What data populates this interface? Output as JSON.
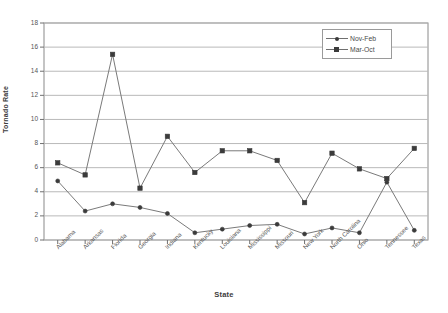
{
  "chart_data": {
    "type": "line",
    "title": "",
    "xlabel": "State",
    "ylabel": "Tornado Rate",
    "ylim": [
      0,
      18
    ],
    "ytick_step": 2,
    "yticks": [
      "0",
      "2",
      "4",
      "6",
      "8",
      "10",
      "12",
      "14",
      "16",
      "18"
    ],
    "grid": true,
    "legend_position": "top-right",
    "categories": [
      "Alabama",
      "Arkansas",
      "Florida",
      "Georgia",
      "Indiana",
      "Kentucky",
      "Louisiana",
      "Mississippi",
      "Missouri",
      "New York",
      "North Carolina",
      "Ohio",
      "Tennessee",
      "Texas"
    ],
    "series": [
      {
        "name": "Nov-Feb",
        "marker": "diamond",
        "color": "#3b3b3b",
        "values": [
          4.9,
          2.4,
          3.0,
          2.7,
          2.2,
          0.6,
          0.9,
          1.2,
          1.3,
          0.5,
          1.0,
          0.6,
          4.8,
          0.8
        ]
      },
      {
        "name": "Mar-Oct",
        "marker": "square",
        "color": "#3b3b3b",
        "values": [
          6.4,
          5.4,
          15.4,
          4.3,
          8.6,
          5.6,
          7.4,
          7.4,
          6.6,
          3.1,
          7.2,
          5.9,
          5.1,
          7.6
        ]
      }
    ]
  },
  "legend": {
    "items": [
      {
        "label": "Nov-Feb",
        "marker": "diamond"
      },
      {
        "label": "Mar-Oct",
        "marker": "square"
      }
    ]
  },
  "axes": {
    "y_title": "Tornado Rate",
    "x_title": "State"
  }
}
